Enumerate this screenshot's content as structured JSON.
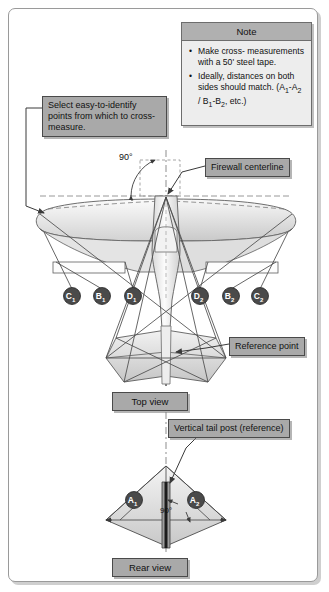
{
  "figure": {
    "frame_color": "#9a9a9a",
    "label_bg": "#a9a9a9",
    "note_bg": "#ededed"
  },
  "note": {
    "header": "Note",
    "bullets": [
      "Make cross-measurements with a 50' steel tape.",
      "Ideally, distances on both sides should match. (A1-A2 / B1-B2, etc.)"
    ],
    "bullet1_line1": "Make cross-",
    "bullet1_line2": "measurements with a 50'",
    "bullet1_line3": "steel tape.",
    "bullet2_line1": "Ideally, distances on",
    "bullet2_line2": "both sides should match.",
    "bullet2_line3_pre": "(A",
    "bullet2_sub_a1": "1",
    "bullet2_mid_a": "-A",
    "bullet2_sub_a2": "2",
    "bullet2_slash": " / B",
    "bullet2_sub_b1": "1",
    "bullet2_mid_b": "-B",
    "bullet2_sub_b2": "2",
    "bullet2_tail": ", etc.)"
  },
  "callouts": {
    "select_points": "Select easy-to-identify points from which to cross-measure.",
    "firewall_centerline": "Firewall centerline",
    "reference_point": "Reference point",
    "vertical_tail_post": "Vertical tail post (reference)"
  },
  "captions": {
    "top_view": "Top view",
    "rear_view": "Rear view"
  },
  "angles": {
    "top": "90°",
    "rear": "90°"
  },
  "markers": {
    "top_view": [
      {
        "id": "C1",
        "letter": "C",
        "sub": "1",
        "cx": 72,
        "cy": 296
      },
      {
        "id": "B1",
        "letter": "B",
        "sub": "1",
        "cx": 102,
        "cy": 296
      },
      {
        "id": "D1",
        "letter": "D",
        "sub": "1",
        "cx": 133,
        "cy": 296
      },
      {
        "id": "D2",
        "letter": "D",
        "sub": "2",
        "cx": 200,
        "cy": 296
      },
      {
        "id": "B2",
        "letter": "B",
        "sub": "2",
        "cx": 231,
        "cy": 296
      },
      {
        "id": "C2",
        "letter": "C",
        "sub": "2",
        "cx": 260,
        "cy": 296
      }
    ],
    "rear_view": [
      {
        "id": "A1",
        "letter": "A",
        "sub": "1",
        "cx": 134,
        "cy": 500
      },
      {
        "id": "A2",
        "letter": "A",
        "sub": "2",
        "cx": 196,
        "cy": 500
      }
    ]
  }
}
